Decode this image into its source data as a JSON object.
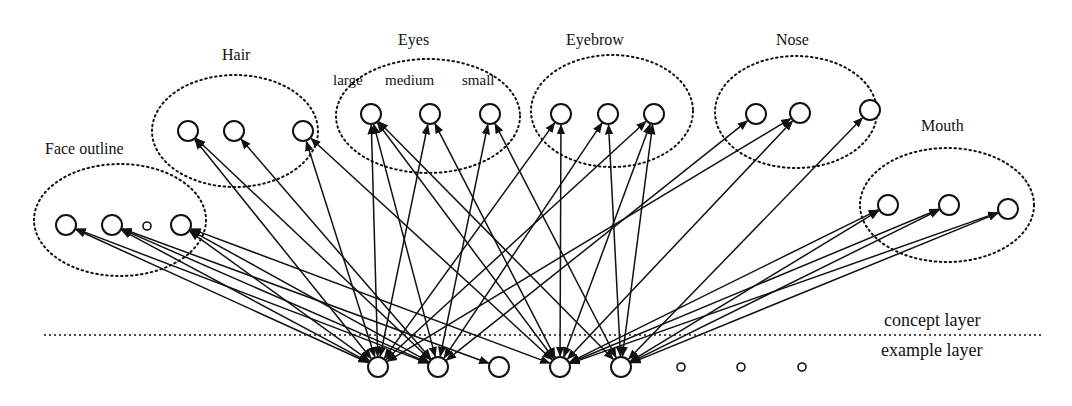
{
  "figure": {
    "groups": [
      {
        "id": "face_outline",
        "label": "Face outline",
        "label_pos": [
          45,
          140
        ],
        "ellipse": {
          "cx": 120,
          "cy": 220,
          "rx": 86,
          "ry": 56
        },
        "nodes": [
          {
            "x": 66,
            "y": 225,
            "r": 10
          },
          {
            "x": 112,
            "y": 225,
            "r": 10
          },
          {
            "x": 147,
            "y": 226,
            "r": 4
          },
          {
            "x": 181,
            "y": 225,
            "r": 10
          }
        ]
      },
      {
        "id": "hair",
        "label": "Hair",
        "label_pos": [
          222,
          46
        ],
        "ellipse": {
          "cx": 235,
          "cy": 131,
          "rx": 83,
          "ry": 56
        },
        "nodes": [
          {
            "x": 188,
            "y": 131,
            "r": 10
          },
          {
            "x": 234,
            "y": 131,
            "r": 10
          },
          {
            "x": 303,
            "y": 131,
            "r": 10
          }
        ]
      },
      {
        "id": "eyes",
        "label": "Eyes",
        "label_pos": [
          398,
          31
        ],
        "ellipse": {
          "cx": 428,
          "cy": 116,
          "rx": 92,
          "ry": 57
        },
        "sub_labels": [
          {
            "text": "large",
            "x": 333,
            "y": 78
          },
          {
            "text": "medium",
            "x": 385,
            "y": 78
          },
          {
            "text": "small",
            "x": 462,
            "y": 78
          }
        ],
        "nodes": [
          {
            "x": 371,
            "y": 114,
            "r": 10
          },
          {
            "x": 430,
            "y": 114,
            "r": 10
          },
          {
            "x": 490,
            "y": 114,
            "r": 10
          }
        ]
      },
      {
        "id": "eyebrow",
        "label": "Eyebrow",
        "label_pos": [
          566,
          31
        ],
        "ellipse": {
          "cx": 612,
          "cy": 111,
          "rx": 81,
          "ry": 56
        },
        "nodes": [
          {
            "x": 561,
            "y": 114,
            "r": 10
          },
          {
            "x": 608,
            "y": 114,
            "r": 10
          },
          {
            "x": 654,
            "y": 114,
            "r": 10
          }
        ]
      },
      {
        "id": "nose",
        "label": "Nose",
        "label_pos": [
          776,
          31
        ],
        "ellipse": {
          "cx": 796,
          "cy": 112,
          "rx": 81,
          "ry": 56
        },
        "nodes": [
          {
            "x": 756,
            "y": 114,
            "r": 10
          },
          {
            "x": 800,
            "y": 113,
            "r": 10
          },
          {
            "x": 870,
            "y": 110,
            "r": 10
          }
        ]
      },
      {
        "id": "mouth",
        "label": "Mouth",
        "label_pos": [
          921,
          117
        ],
        "ellipse": {
          "cx": 947,
          "cy": 205,
          "rx": 87,
          "ry": 57
        },
        "nodes": [
          {
            "x": 888,
            "y": 205,
            "r": 10
          },
          {
            "x": 949,
            "y": 205,
            "r": 10
          },
          {
            "x": 1008,
            "y": 209,
            "r": 10
          }
        ]
      }
    ],
    "example_nodes": [
      {
        "x": 378,
        "y": 367,
        "r": 10
      },
      {
        "x": 438,
        "y": 367,
        "r": 10
      },
      {
        "x": 499,
        "y": 367,
        "r": 10
      },
      {
        "x": 560,
        "y": 367,
        "r": 10
      },
      {
        "x": 621,
        "y": 367,
        "r": 10
      },
      {
        "x": 681,
        "y": 367,
        "r": 4
      },
      {
        "x": 741,
        "y": 367,
        "r": 4
      },
      {
        "x": 802,
        "y": 367,
        "r": 4
      }
    ],
    "separator": {
      "x1": 44,
      "x2": 1042,
      "y": 335
    },
    "layer_labels": {
      "concept": "concept layer",
      "example": "example layer"
    },
    "edges": [
      [
        "face_outline",
        0,
        0
      ],
      [
        "face_outline",
        0,
        1
      ],
      [
        "face_outline",
        1,
        0
      ],
      [
        "face_outline",
        1,
        1
      ],
      [
        "face_outline",
        1,
        2
      ],
      [
        "face_outline",
        3,
        0
      ],
      [
        "face_outline",
        3,
        1
      ],
      [
        "face_outline",
        3,
        3
      ],
      [
        "hair",
        0,
        0
      ],
      [
        "hair",
        0,
        1
      ],
      [
        "hair",
        1,
        1
      ],
      [
        "hair",
        2,
        0
      ],
      [
        "hair",
        2,
        3
      ],
      [
        "eyes",
        0,
        0
      ],
      [
        "eyes",
        0,
        1
      ],
      [
        "eyes",
        0,
        3
      ],
      [
        "eyes",
        0,
        4
      ],
      [
        "eyes",
        1,
        0
      ],
      [
        "eyes",
        1,
        3
      ],
      [
        "eyes",
        2,
        1
      ],
      [
        "eyes",
        2,
        4
      ],
      [
        "eyebrow",
        0,
        0
      ],
      [
        "eyebrow",
        0,
        3
      ],
      [
        "eyebrow",
        1,
        1
      ],
      [
        "eyebrow",
        1,
        4
      ],
      [
        "eyebrow",
        2,
        0
      ],
      [
        "eyebrow",
        2,
        3
      ],
      [
        "eyebrow",
        2,
        4
      ],
      [
        "nose",
        0,
        1
      ],
      [
        "nose",
        1,
        0
      ],
      [
        "nose",
        1,
        3
      ],
      [
        "nose",
        2,
        4
      ],
      [
        "mouth",
        0,
        3
      ],
      [
        "mouth",
        0,
        4
      ],
      [
        "mouth",
        1,
        3
      ],
      [
        "mouth",
        1,
        4
      ],
      [
        "mouth",
        2,
        3
      ],
      [
        "mouth",
        2,
        4
      ]
    ]
  }
}
